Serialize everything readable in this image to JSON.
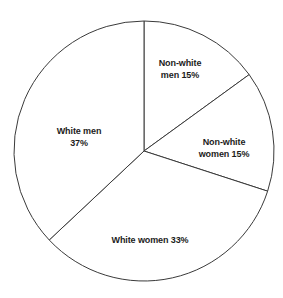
{
  "figure": {
    "background_color": "#ffffff",
    "outline_color": "#3a3a3a",
    "label_color": "#1c1c1c"
  },
  "chart_data": {
    "type": "pie",
    "title": "",
    "subtitle": "",
    "xlabel": "",
    "ylabel": "",
    "grid": false,
    "legend_position": "none",
    "labels_inside": true,
    "start_angle_deg": 90,
    "direction": "clockwise",
    "center": {
      "x": 144,
      "y": 151
    },
    "radius": 130,
    "units": "percent",
    "total": 100,
    "categories": [
      "Non-white men",
      "Non-white women",
      "White women",
      "White men"
    ],
    "values": [
      15,
      15,
      33,
      37
    ],
    "slices": [
      {
        "name": "Non-white men",
        "value": 15,
        "value_label": "15%",
        "label_text": "Non-white\nmen 15%",
        "start_deg": 0,
        "end_deg": 54,
        "label_x": 180,
        "label_y": 69
      },
      {
        "name": "Non-white women",
        "value": 15,
        "value_label": "15%",
        "label_text": "Non-white\nwomen 15%",
        "start_deg": 54,
        "end_deg": 108,
        "label_x": 224,
        "label_y": 148
      },
      {
        "name": "White women",
        "value": 33,
        "value_label": "33%",
        "label_text": "White women 33%",
        "start_deg": 108,
        "end_deg": 226.8,
        "label_x": 150,
        "label_y": 241
      },
      {
        "name": "White men",
        "value": 37,
        "value_label": "37%",
        "label_text": "White men\n37%",
        "start_deg": 226.8,
        "end_deg": 360,
        "label_x": 79,
        "label_y": 137
      }
    ]
  }
}
